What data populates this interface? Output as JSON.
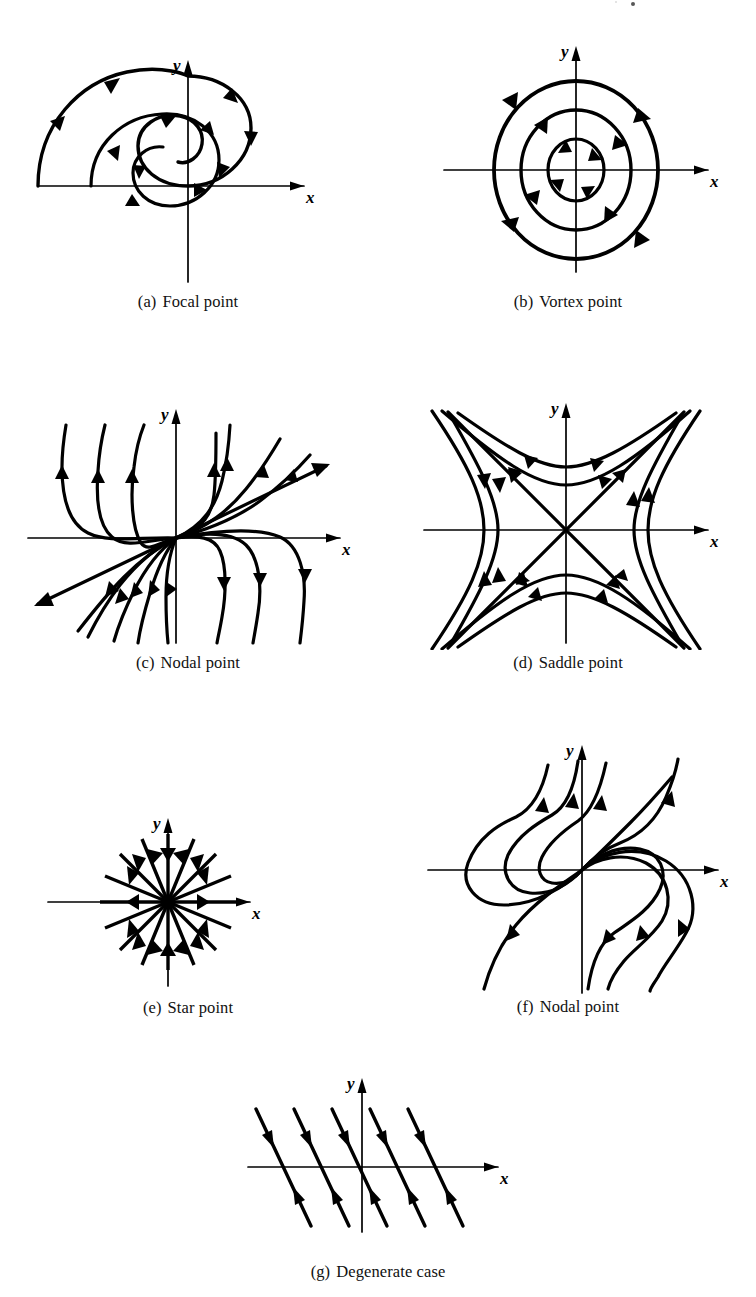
{
  "figure": {
    "kind": "phase-portrait-plate",
    "background": "#ffffff",
    "ink": "#000000",
    "axis_labels": {
      "x": "x",
      "y": "y"
    },
    "panels": [
      {
        "id": "a",
        "label": "(a)",
        "title": "Focal point",
        "caption": "(a)  Focal point",
        "type": "spiral",
        "description": "Inward clockwise spiral about the origin; one trajectory drawn through about two and a half turns.",
        "turns": 2.6,
        "spiral_direction": "clockwise-inward",
        "arrow_count": 9
      },
      {
        "id": "b",
        "label": "(b)",
        "title": "Vortex point",
        "caption": "(b)  Vortex point",
        "type": "closed-orbits",
        "description": "Three concentric closed orbits traversed clockwise about the origin.",
        "orbit_radii_px": [
          26,
          52,
          78
        ],
        "orbit_count": 3,
        "orbit_direction": "clockwise",
        "arrows_per_orbit": 4
      },
      {
        "id": "c",
        "label": "(c)",
        "title": "Nodal point",
        "caption": "(c)  Nodal point",
        "type": "node",
        "description": "Unstable node: all trajectories leave the origin, tangent to a common slow direction; two straight separatrix rays along that direction.",
        "flow": "outward",
        "tangent_angle_deg": 25,
        "trajectory_count": 14
      },
      {
        "id": "d",
        "label": "(d)",
        "title": "Saddle point",
        "caption": "(d)  Saddle point",
        "type": "saddle",
        "description": "Hyperbolic trajectories with two straight separatrices at plus and minus 45 degrees; flow in along one asymptote and out along the other.",
        "separatrix_angles_deg": [
          45,
          -45
        ],
        "branch_count": 4,
        "curves_per_branch": 2
      },
      {
        "id": "e",
        "label": "(e)",
        "title": "Star point",
        "caption": "(e)  Star point",
        "type": "star",
        "description": "Stable star (proper) node: sixteen straight rays directed radially inward to the origin.",
        "flow": "inward",
        "ray_count": 16
      },
      {
        "id": "f",
        "label": "(f)",
        "title": "Nodal point",
        "caption": "(f)  Nodal point",
        "type": "degenerate-node",
        "description": "Improper node: every trajectory leaves the origin tangent to the single eigendirection at about 45 degrees, looping back before escaping.",
        "flow": "outward",
        "tangent_angle_deg": 45,
        "trajectory_count": 8
      },
      {
        "id": "g",
        "label": "(g)",
        "title": "Degenerate case",
        "caption": "(g)  Degenerate case",
        "type": "parallel-lines",
        "description": "A line of equilibria along the x-axis; parallel straight trajectories of negative slope with arrows on both sides pointing toward the axis.",
        "line_count": 5,
        "line_slope_deg": -52,
        "flow": "toward-x-axis"
      }
    ]
  }
}
